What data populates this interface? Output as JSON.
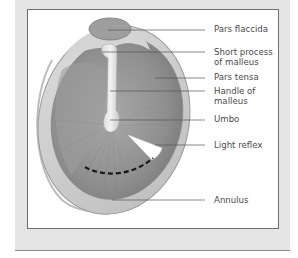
{
  "figure": {
    "labels": [
      {
        "id": "pars-flaccida",
        "lines": [
          "Pars flaccida"
        ],
        "x": 214,
        "y": 24
      },
      {
        "id": "short-process",
        "lines": [
          "Short process",
          "of malleus"
        ],
        "x": 214,
        "y": 47
      },
      {
        "id": "pars-tensa",
        "lines": [
          "Pars tensa"
        ],
        "x": 214,
        "y": 72
      },
      {
        "id": "handle-of-malleus",
        "lines": [
          "Handle of",
          "malleus"
        ],
        "x": 214,
        "y": 86
      },
      {
        "id": "umbo",
        "lines": [
          "Umbo"
        ],
        "x": 214,
        "y": 114
      },
      {
        "id": "light-reflex",
        "lines": [
          "Light reflex"
        ],
        "x": 214,
        "y": 140
      },
      {
        "id": "annulus",
        "lines": [
          "Annulus"
        ],
        "x": 214,
        "y": 195
      }
    ],
    "leader_lines": [
      {
        "id": "pars-flaccida",
        "x1": 108,
        "y1": 30,
        "x2": 205,
        "y2": 30
      },
      {
        "id": "short-process",
        "x1": 102,
        "y1": 52,
        "x2": 205,
        "y2": 52
      },
      {
        "id": "pars-tensa",
        "x1": 155,
        "y1": 78,
        "x2": 205,
        "y2": 78
      },
      {
        "id": "handle-of-malleus",
        "x1": 110,
        "y1": 91,
        "x2": 205,
        "y2": 91
      },
      {
        "id": "umbo",
        "x1": 110,
        "y1": 120,
        "x2": 205,
        "y2": 120
      },
      {
        "id": "light-reflex",
        "x1": 155,
        "y1": 145,
        "x2": 205,
        "y2": 145
      },
      {
        "id": "annulus",
        "x1": 112,
        "y1": 200,
        "x2": 205,
        "y2": 200
      }
    ],
    "colors": {
      "panel": "#e4e4e4",
      "frame": "#6f6f6f",
      "membrane": "#9a9a9a",
      "annulus": "#cfcfcf",
      "label_text": "#4a4a4a",
      "leader": "#555555"
    }
  }
}
